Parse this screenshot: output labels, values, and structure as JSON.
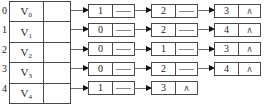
{
  "diagram": {
    "null_symbol": "∧",
    "head_table": {
      "rows": [
        {
          "index": "0",
          "vertex": "V",
          "subscript": "0"
        },
        {
          "index": "1",
          "vertex": "V",
          "subscript": "1"
        },
        {
          "index": "2",
          "vertex": "V",
          "subscript": "2"
        },
        {
          "index": "3",
          "vertex": "V",
          "subscript": "3"
        },
        {
          "index": "4",
          "vertex": "V",
          "subscript": "4"
        }
      ]
    },
    "adjacency": [
      {
        "index": "0",
        "nodes": [
          "1",
          "2",
          "3"
        ]
      },
      {
        "index": "1",
        "nodes": [
          "0",
          "2",
          "4"
        ]
      },
      {
        "index": "2",
        "nodes": [
          "0",
          "1",
          "3"
        ]
      },
      {
        "index": "3",
        "nodes": [
          "0",
          "2",
          "4"
        ]
      },
      {
        "index": "4",
        "nodes": [
          "1",
          "3"
        ]
      }
    ]
  },
  "colors": {
    "border": "#4a4a4a",
    "arrow": "#6f6f6f",
    "arrowhead": "#111111",
    "stub": "#8a8a8a",
    "background": "#ffffff",
    "text": "#1a1a1a"
  }
}
